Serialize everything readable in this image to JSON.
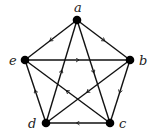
{
  "diagram": {
    "type": "directed-graph",
    "nodes": [
      {
        "id": "a",
        "label": "a",
        "x": 77,
        "y": 20,
        "label_x": 74,
        "label_y": 12
      },
      {
        "id": "b",
        "label": "b",
        "x": 130,
        "y": 60,
        "label_x": 139,
        "label_y": 65
      },
      {
        "id": "c",
        "label": "c",
        "x": 110,
        "y": 123,
        "label_x": 119,
        "label_y": 128
      },
      {
        "id": "d",
        "label": "d",
        "x": 46,
        "y": 123,
        "label_x": 28,
        "label_y": 128
      },
      {
        "id": "e",
        "label": "e",
        "x": 25,
        "y": 60,
        "label_x": 9,
        "label_y": 65
      }
    ],
    "edges": [
      {
        "from": "a",
        "to": "e"
      },
      {
        "from": "a",
        "to": "b"
      },
      {
        "from": "e",
        "to": "b"
      },
      {
        "from": "a",
        "to": "c"
      },
      {
        "from": "d",
        "to": "a"
      },
      {
        "from": "d",
        "to": "e"
      },
      {
        "from": "b",
        "to": "c"
      },
      {
        "from": "c",
        "to": "d"
      },
      {
        "from": "c",
        "to": "e"
      },
      {
        "from": "b",
        "to": "d"
      }
    ],
    "colors": {
      "edge": "#111111",
      "node": "#000000",
      "label": "#222222",
      "background": "#ffffff"
    }
  }
}
